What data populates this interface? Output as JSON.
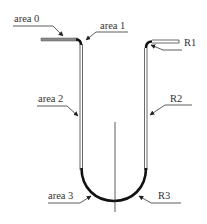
{
  "diagram": {
    "type": "U-shaped bent sheet cross-section",
    "labels": {
      "area0": "area 0",
      "area1": "area 1",
      "area2": "area 2",
      "area3": "area 3",
      "r1": "R1",
      "r2": "R2",
      "r3": "R3"
    },
    "colors": {
      "line": "#333333",
      "flange_fill": "#8a8a8a",
      "thick_curve": "#111111",
      "background": "#ffffff"
    }
  }
}
